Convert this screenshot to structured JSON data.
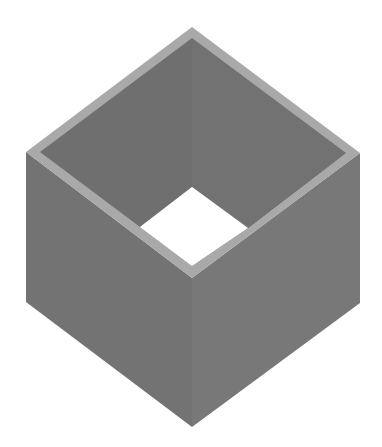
{
  "figure": {
    "colors": {
      "background": "#ffffff",
      "rim": "#a9a9a9",
      "inner_back_left": "#6f6f6f",
      "inner_back_right": "#727272",
      "outer_left": "#737373",
      "outer_right": "#787878",
      "hole": "#ffffff"
    },
    "shapes": {
      "outer_left_face": "26,152 192,278 192,427 26,302",
      "outer_right_face": "192,278 360,153 360,303 192,427",
      "rim": "192,27 360,153 192,278 26,152",
      "inner_back_left": "192,38 192,187 140,227 40,152",
      "inner_back_right": "192,38 346,153 248,228 192,187",
      "inner_front_left": "40,152 140,227 192,266",
      "inner_front_right": "346,153 192,266 248,228",
      "hole": "192,187 248,228 192,266 140,227",
      "seam_back": "192,38 192,187",
      "seam_front": "192,278 192,427"
    }
  }
}
